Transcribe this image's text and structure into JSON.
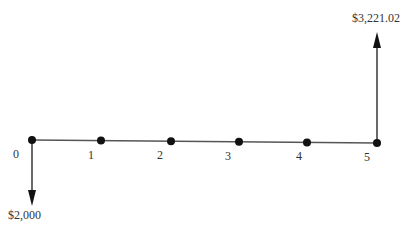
{
  "diagram": {
    "type": "cash-flow-timeline",
    "periods": [
      "0",
      "1",
      "2",
      "3",
      "4",
      "5"
    ],
    "cash_flows": [
      {
        "period": "0",
        "direction": "down",
        "amount_label": "$2,000"
      },
      {
        "period": "5",
        "direction": "up",
        "amount_label": "$3,221.02"
      }
    ],
    "colors": {
      "line": "#555555",
      "point": "#111111",
      "arrow": "#111111"
    }
  }
}
